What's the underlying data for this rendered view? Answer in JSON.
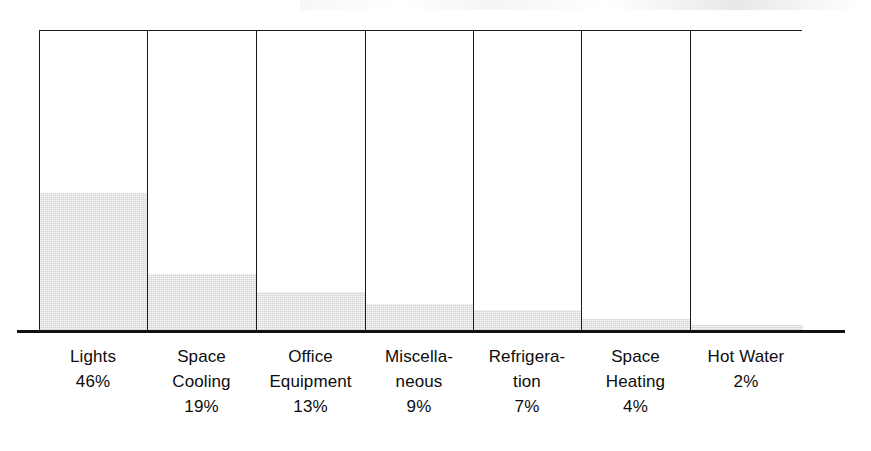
{
  "chart_data": {
    "type": "bar",
    "title": "",
    "subtitle": "",
    "xlabel": "",
    "ylabel": "",
    "ylim": [
      0,
      100
    ],
    "grid": false,
    "legend": false,
    "units": "percent",
    "categories": [
      "Lights",
      "Space\nCooling",
      "Office\nEquipment",
      "Miscella-\nneous",
      "Refrigera-\ntion",
      "Space\nHeating",
      "Hot Water"
    ],
    "values": [
      46,
      19,
      13,
      9,
      7,
      4,
      2
    ],
    "value_labels": [
      "46%",
      "19%",
      "13%",
      "9%",
      "7%",
      "4%",
      "2%"
    ],
    "bar_fill_color": "#d3d3d3",
    "bar_outline_color": "#1a1a1a",
    "axis_color": "#111111",
    "bars": [
      {
        "category": "Lights",
        "label_lines": "Lights",
        "value": 46,
        "value_label": "46%",
        "width_px": 108
      },
      {
        "category": "Space Cooling",
        "label_lines": "Space\nCooling",
        "value": 19,
        "value_label": "19%",
        "width_px": 109
      },
      {
        "category": "Office Equipment",
        "label_lines": "Office\nEquipment",
        "value": 13,
        "value_label": "13%",
        "width_px": 109
      },
      {
        "category": "Miscellaneous",
        "label_lines": "Miscella-\nneous",
        "value": 9,
        "value_label": "9%",
        "width_px": 108
      },
      {
        "category": "Refrigeration",
        "label_lines": "Refrigera-\ntion",
        "value": 7,
        "value_label": "7%",
        "width_px": 108
      },
      {
        "category": "Space Heating",
        "label_lines": "Space\nHeating",
        "value": 4,
        "value_label": "4%",
        "width_px": 109
      },
      {
        "category": "Hot Water",
        "label_lines": "Hot Water",
        "value": 2,
        "value_label": "2%",
        "width_px": 112
      }
    ]
  }
}
